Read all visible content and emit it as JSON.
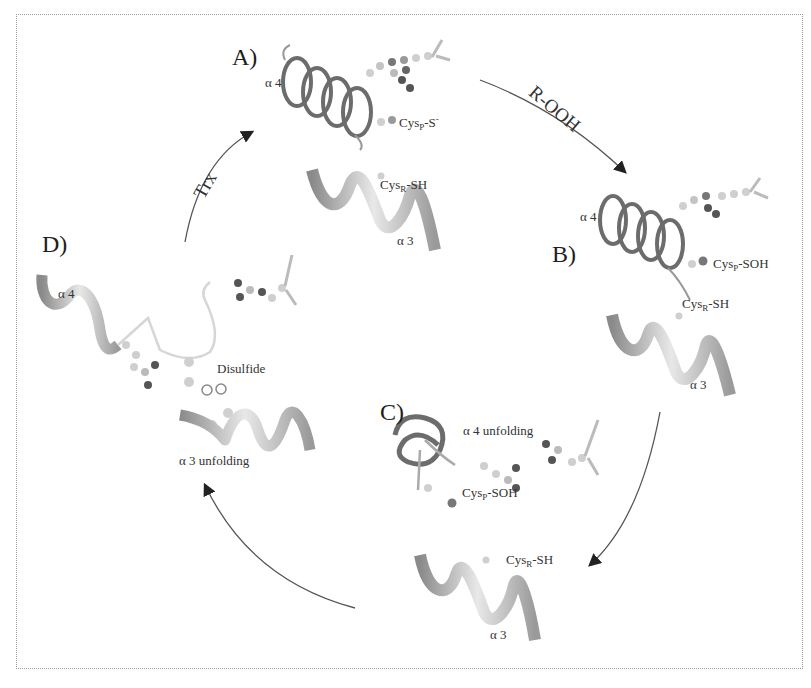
{
  "figure": {
    "panels": [
      {
        "id": "A",
        "label": "A)",
        "annotations": {
          "helix_top": "α 4",
          "cys_p": {
            "base": "Cys",
            "sub": "P",
            "suffix": "-S",
            "sup": "-"
          },
          "cys_r": {
            "base": "Cys",
            "sub": "R",
            "suffix": "-SH"
          },
          "helix_bottom": "α 3"
        }
      },
      {
        "id": "B",
        "label": "B)",
        "annotations": {
          "helix_top": "α 4",
          "cys_p": {
            "base": "Cys",
            "sub": "P",
            "suffix": "-SOH"
          },
          "cys_r": {
            "base": "Cys",
            "sub": "R",
            "suffix": "-SH"
          },
          "helix_bottom": "α 3"
        }
      },
      {
        "id": "C",
        "label": "C)",
        "annotations": {
          "unfolding": "α 4 unfolding",
          "cys_p": {
            "base": "Cys",
            "sub": "P",
            "suffix": "-SOH"
          },
          "cys_r": {
            "base": "Cys",
            "sub": "R",
            "suffix": "-SH"
          },
          "helix_bottom": "α 3"
        }
      },
      {
        "id": "D",
        "label": "D)",
        "annotations": {
          "helix_top": "α 4",
          "disulfide": "Disulfide",
          "unfolding": "α 3 unfolding"
        }
      }
    ],
    "transitions": [
      {
        "from": "A",
        "to": "B",
        "label": "R-OOH"
      },
      {
        "from": "B",
        "to": "C",
        "label": ""
      },
      {
        "from": "C",
        "to": "D",
        "label": ""
      },
      {
        "from": "D",
        "to": "A",
        "label": "Trx"
      }
    ],
    "colors": {
      "arrow": "#555555",
      "ribbon_dark": "#6e6e6e",
      "ribbon_light": "#e6e6e6",
      "atom_light": "#cfcfcf",
      "atom_dark": "#5a5a5a",
      "frame": "#9a9a9a"
    }
  }
}
